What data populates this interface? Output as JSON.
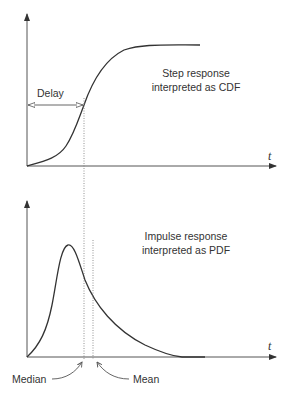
{
  "figure": {
    "top_panel": {
      "title_line1": "Step response",
      "title_line2": "interpreted as CDF",
      "delay_label": "Delay",
      "x_axis_label": "t"
    },
    "bottom_panel": {
      "title_line1": "Impulse response",
      "title_line2": "interpreted as PDF",
      "median_label": "Median",
      "mean_label": "Mean",
      "x_axis_label": "t"
    },
    "colors": {
      "line": "#333333",
      "axis": "#555555",
      "dotted": "#777777"
    }
  }
}
